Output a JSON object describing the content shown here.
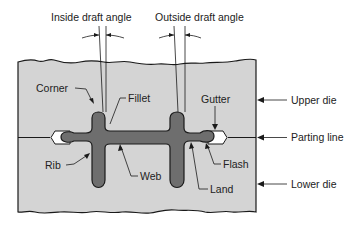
{
  "diagram": {
    "colors": {
      "die_fill": "#d4d4d4",
      "part_fill": "#6e6e6e",
      "flash_gutter_fill": "#ffffff",
      "line": "#1a1a1a",
      "background": "#ffffff"
    },
    "top_labels": {
      "inside_draft_angle": "Inside draft angle",
      "outside_draft_angle": "Outside draft angle"
    },
    "part_labels": {
      "corner": "Corner",
      "fillet": "Fillet",
      "gutter": "Gutter",
      "rib": "Rib",
      "web": "Web",
      "flash": "Flash",
      "land": "Land"
    },
    "side_labels": {
      "upper_die": "Upper die",
      "parting_line": "Parting line",
      "lower_die": "Lower die"
    }
  }
}
